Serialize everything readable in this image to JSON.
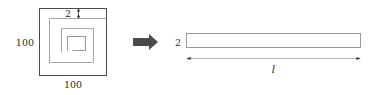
{
  "figure": {
    "colors": {
      "outer_square_stroke": "#4a4a4a",
      "spiral_stroke": "#a6a6a6",
      "strip_stroke": "#9a9a9a",
      "dimension_line": "#b0b0b0",
      "dimension_tick": "#2b2b2b",
      "arrow_fill": "#4a4a4a",
      "label_text": "#2b2b2b",
      "background": "#ffffff"
    },
    "left_diagram": {
      "name": "square-with-spiral-cut",
      "labels": {
        "left_side": "100",
        "bottom_side": "100",
        "strip_width": "2"
      }
    },
    "transform_arrow": {
      "name": "transform-arrow",
      "direction": "right"
    },
    "right_diagram": {
      "name": "unrolled-strip",
      "labels": {
        "strip_width": "2",
        "strip_length": "l"
      }
    }
  }
}
